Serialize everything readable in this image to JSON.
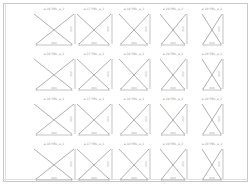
{
  "sheet": {
    "title": "Drawing sheet",
    "border_color": "#c8c8c8",
    "line_color": "#9a9a9a",
    "text_color": "#9a9a9a",
    "grid": {
      "rows": 4,
      "cols": 5
    }
  },
  "columns": [
    {
      "center_x": 54,
      "width": 40,
      "bottom_width": 18,
      "dim_label": "XXX"
    },
    {
      "center_x": 94,
      "width": 34,
      "bottom_width": 14,
      "dim_label": "XXX"
    },
    {
      "center_x": 134,
      "width": 30,
      "bottom_width": 12,
      "dim_label": "XXX"
    },
    {
      "center_x": 173,
      "width": 26,
      "bottom_width": 10,
      "dim_label": "XXX"
    },
    {
      "center_x": 212,
      "width": 20,
      "bottom_width": 10,
      "dim_label": "XXX"
    }
  ],
  "rows": [
    {
      "top": 14,
      "height": 30
    },
    {
      "top": 59,
      "height": 30
    },
    {
      "top": 104,
      "height": 30
    },
    {
      "top": 149,
      "height": 30
    }
  ],
  "cells": [
    [
      "a-16°PBL_a_2",
      "a-17°PBL_a_2",
      "a-18°PBL_a_2",
      "a-19°PBL_a_2",
      "a-20°PBL_a_2"
    ],
    [
      "a-16°PBL_a_2",
      "a-17°PBL_a_2",
      "a-18°PBL_a_2",
      "a-19°PBL_a_2",
      "a-20°PBL_a_2"
    ],
    [
      "a-16°PBL_a_2",
      "a-17°PBL_a_2",
      "a-18°PBL_a_2",
      "a-19°PBL_a_2",
      "a-20°PBL_a_2"
    ],
    [
      "a-16°PBL_a_2",
      "a-17°PBL_a_2",
      "a-18°PBL_a_2",
      "a-19°PBL_a_2",
      "a-20°PBL_a_2"
    ]
  ],
  "vertical_dim_label": "XXX"
}
